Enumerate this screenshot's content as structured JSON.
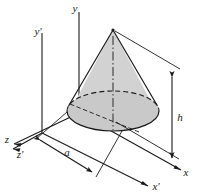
{
  "figure": {
    "background_color": "#ffffff",
    "line_color": "#1a1a1a",
    "cone_fill_color": "#d2d2d2",
    "base_fill_color": "#c9c9c9",
    "centerline_color": "#7a7a7a"
  },
  "axes": [
    {
      "key": "y",
      "label": "y",
      "orientation": "vertical",
      "frame": "unprimed"
    },
    {
      "key": "x",
      "label": "x",
      "orientation": "down-right",
      "frame": "unprimed"
    },
    {
      "key": "z",
      "label": "z",
      "orientation": "left",
      "frame": "unprimed"
    },
    {
      "key": "y-prime",
      "label": "y'",
      "orientation": "vertical",
      "frame": "primed"
    },
    {
      "key": "x-prime",
      "label": "x'",
      "orientation": "down-right",
      "frame": "primed"
    },
    {
      "key": "z-prime",
      "label": "z'",
      "orientation": "left",
      "frame": "primed"
    }
  ],
  "dimensions": [
    {
      "key": "radius",
      "label": "a",
      "describes": "base radius of cone",
      "style": "double-arrow"
    },
    {
      "key": "height",
      "label": "h",
      "describes": "height of cone",
      "style": "double-arrow"
    }
  ],
  "solid": {
    "name": "cone",
    "apex_label": "",
    "base_shape": "ellipse",
    "centerline_style": "dash-dot"
  }
}
